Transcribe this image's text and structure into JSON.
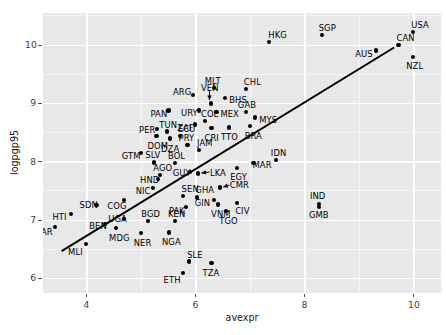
{
  "chart_data": {
    "type": "scatter",
    "title": "",
    "subtitle": "",
    "xlabel": "avexpr",
    "ylabel": "logpgp95",
    "xlim": [
      3.2,
      10.5
    ],
    "ylim": [
      5.75,
      10.55
    ],
    "xticks": [
      4,
      6,
      8,
      10
    ],
    "yticks": [
      6,
      7,
      8,
      9,
      10
    ],
    "xticklabels": [
      "4",
      "6",
      "8",
      "10"
    ],
    "yticklabels": [
      "6",
      "7",
      "8",
      "9",
      "10"
    ],
    "grid": true,
    "legend": null,
    "panel_background": "#e8e8e8",
    "gridline_color": "#ffffff",
    "point_color": "#000000",
    "fit_line": {
      "type": "linear-regression",
      "color": "#000000",
      "x_start": 3.55,
      "y_start": 6.46,
      "x_end": 9.65,
      "y_end": 9.95
    },
    "points": [
      {
        "label": "HTI",
        "x": 3.73,
        "y": 7.1,
        "lx": -19,
        "ly": 2
      },
      {
        "label": "ZAR",
        "x": 3.43,
        "y": 6.87,
        "lx": -20,
        "ly": 4
      },
      {
        "label": "MLI",
        "x": 4.0,
        "y": 6.58,
        "lx": -18,
        "ly": 7
      },
      {
        "label": "SDN",
        "x": 4.19,
        "y": 7.25,
        "lx": -17,
        "ly": -1
      },
      {
        "label": "BEN",
        "x": 4.35,
        "y": 6.93,
        "lx": -16,
        "ly": 1
      },
      {
        "label": "MDG",
        "x": 4.55,
        "y": 6.85,
        "lx": -7,
        "ly": 9
      },
      {
        "label": "COG",
        "x": 4.7,
        "y": 7.33,
        "lx": -17,
        "ly": 5
      },
      {
        "label": "UGA",
        "x": 4.7,
        "y": 7.01,
        "lx": -16,
        "ly": -1
      },
      {
        "label": "NER",
        "x": 5.0,
        "y": 6.77,
        "lx": -7,
        "ly": 9
      },
      {
        "label": "NIC",
        "x": 5.22,
        "y": 7.54,
        "lx": -17,
        "ly": 2
      },
      {
        "label": "HND",
        "x": 5.32,
        "y": 7.69,
        "lx": -18,
        "ly": 0
      },
      {
        "label": "GTM",
        "x": 5.0,
        "y": 8.14,
        "lx": -19,
        "ly": 2
      },
      {
        "label": "SLV",
        "x": 5.25,
        "y": 7.98,
        "lx": -9,
        "ly": -8
      },
      {
        "label": "AGO",
        "x": 5.36,
        "y": 7.77,
        "lx": -7,
        "ly": -8
      },
      {
        "label": "BOL",
        "x": 5.63,
        "y": 7.97,
        "lx": -7,
        "ly": -8
      },
      {
        "label": "GUY",
        "x": 5.9,
        "y": 7.81,
        "lx": -17,
        "ly": 0
      },
      {
        "label": "SEN",
        "x": 5.77,
        "y": 7.41,
        "lx": -1,
        "ly": -8
      },
      {
        "label": "PAK",
        "x": 5.83,
        "y": 7.22,
        "lx": -17,
        "ly": 3
      },
      {
        "label": "GHA",
        "x": 6.04,
        "y": 7.38,
        "lx": -2,
        "ly": -8
      },
      {
        "label": "BGD",
        "x": 5.14,
        "y": 6.97,
        "lx": -7,
        "ly": -8
      },
      {
        "label": "KEN",
        "x": 5.63,
        "y": 6.98,
        "lx": -7,
        "ly": -8
      },
      {
        "label": "NGA",
        "x": 5.52,
        "y": 6.78,
        "lx": -7,
        "ly": 9
      },
      {
        "label": "ETH",
        "x": 5.77,
        "y": 6.09,
        "lx": -19,
        "ly": 6
      },
      {
        "label": "SLE",
        "x": 5.89,
        "y": 6.28,
        "lx": -2,
        "ly": -8
      },
      {
        "label": "TZA",
        "x": 6.3,
        "y": 6.25,
        "lx": -9,
        "ly": 9
      },
      {
        "label": "VNM",
        "x": 6.42,
        "y": 7.26,
        "lx": -7,
        "ly": 9
      },
      {
        "label": "TGO",
        "x": 6.57,
        "y": 7.15,
        "lx": -7,
        "ly": 9
      },
      {
        "label": "CIV",
        "x": 6.77,
        "y": 7.28,
        "lx": -2,
        "ly": 7
      },
      {
        "label": "GIN",
        "x": 6.34,
        "y": 7.34,
        "lx": -19,
        "ly": 2
      },
      {
        "label": "CMR",
        "x": 6.45,
        "y": 7.55,
        "lx": 10,
        "ly": -4
      },
      {
        "label": "LKA",
        "x": 6.05,
        "y": 7.79,
        "lx": 12,
        "ly": -2
      },
      {
        "label": "EGY",
        "x": 6.77,
        "y": 7.88,
        "lx": -7,
        "ly": 8
      },
      {
        "label": "MAR",
        "x": 7.07,
        "y": 7.97,
        "lx": -1,
        "ly": 1
      },
      {
        "label": "IDN",
        "x": 7.48,
        "y": 8.02,
        "lx": -5,
        "ly": -8
      },
      {
        "label": "JAM",
        "x": 6.07,
        "y": 8.19,
        "lx": -2,
        "ly": -8
      },
      {
        "label": "PRY",
        "x": 5.86,
        "y": 8.28,
        "lx": -9,
        "ly": -8
      },
      {
        "label": "DZA",
        "x": 5.54,
        "y": 8.39,
        "lx": -9,
        "ly": 9
      },
      {
        "label": "DOM",
        "x": 5.29,
        "y": 8.43,
        "lx": -9,
        "ly": 9
      },
      {
        "label": "ECU",
        "x": 5.72,
        "y": 8.43,
        "lx": -2,
        "ly": -8
      },
      {
        "label": "TUN",
        "x": 5.49,
        "y": 8.51,
        "lx": -8,
        "ly": -8
      },
      {
        "label": "PER",
        "x": 5.3,
        "y": 8.55,
        "lx": -18,
        "ly": 0
      },
      {
        "label": "PAN",
        "x": 5.51,
        "y": 8.87,
        "lx": -18,
        "ly": 2
      },
      {
        "label": "ZAF",
        "x": 6.0,
        "y": 8.63,
        "lx": -18,
        "ly": 2
      },
      {
        "label": "COL",
        "x": 6.18,
        "y": 8.69,
        "lx": -4,
        "ly": -8
      },
      {
        "label": "CRI",
        "x": 6.3,
        "y": 8.57,
        "lx": -7,
        "ly": 9
      },
      {
        "label": "TTO",
        "x": 6.62,
        "y": 8.58,
        "lx": -8,
        "ly": 9
      },
      {
        "label": "BRA",
        "x": 7.0,
        "y": 8.6,
        "lx": -5,
        "ly": 9
      },
      {
        "label": "MYS",
        "x": 7.1,
        "y": 8.75,
        "lx": 4,
        "ly": 1
      },
      {
        "label": "GAB",
        "x": 6.93,
        "y": 8.85,
        "lx": -8,
        "ly": -8
      },
      {
        "label": "MEX",
        "x": 6.39,
        "y": 8.84,
        "lx": 4,
        "ly": 1
      },
      {
        "label": "URY",
        "x": 6.07,
        "y": 8.87,
        "lx": -18,
        "ly": 1
      },
      {
        "label": "VEN",
        "x": 6.29,
        "y": 8.99,
        "lx": -10,
        "ly": -17
      },
      {
        "label": "BHS",
        "x": 6.55,
        "y": 9.09,
        "lx": 4,
        "ly": 1
      },
      {
        "label": "ARG",
        "x": 5.96,
        "y": 9.13,
        "lx": -20,
        "ly": -4
      },
      {
        "label": "MLT",
        "x": 6.34,
        "y": 9.26,
        "lx": -9,
        "ly": -8
      },
      {
        "label": "CHL",
        "x": 6.93,
        "y": 9.24,
        "lx": -2,
        "ly": -8
      },
      {
        "label": "HKG",
        "x": 7.36,
        "y": 10.05,
        "lx": -1,
        "ly": -8
      },
      {
        "label": "SGP",
        "x": 8.32,
        "y": 10.16,
        "lx": -3,
        "ly": -8
      },
      {
        "label": "AUS",
        "x": 9.32,
        "y": 9.9,
        "lx": -21,
        "ly": 3
      },
      {
        "label": "CAN",
        "x": 9.73,
        "y": 9.99,
        "lx": -2,
        "ly": -8
      },
      {
        "label": "NZL",
        "x": 10.0,
        "y": 9.79,
        "lx": -7,
        "ly": 8
      },
      {
        "label": "USA",
        "x": 10.0,
        "y": 10.22,
        "lx": -2,
        "ly": -8
      },
      {
        "label": "IND",
        "x": 8.27,
        "y": 7.27,
        "lx": -9,
        "ly": -9
      },
      {
        "label": "GMB",
        "x": 8.27,
        "y": 7.21,
        "lx": -10,
        "ly": 7
      }
    ],
    "annotations": [
      {
        "label": "VEN",
        "type": "leader-line"
      },
      {
        "label": "LKA",
        "type": "leader-line"
      },
      {
        "label": "CMR",
        "type": "leader-line"
      }
    ]
  }
}
